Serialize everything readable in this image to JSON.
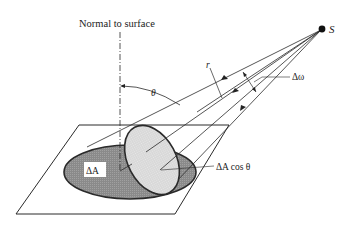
{
  "diagram": {
    "labels": {
      "normal": "Normal to surface",
      "source": "S",
      "theta": "θ",
      "r": "r",
      "delta_omega": "Δω",
      "delta_a": "ΔA",
      "delta_a_cos_theta": "ΔA cos θ"
    },
    "colors": {
      "line": "#2a2a2a",
      "dark_area": "#8c8c8c",
      "light_area": "#d9d9d9",
      "background": "#ffffff"
    }
  }
}
